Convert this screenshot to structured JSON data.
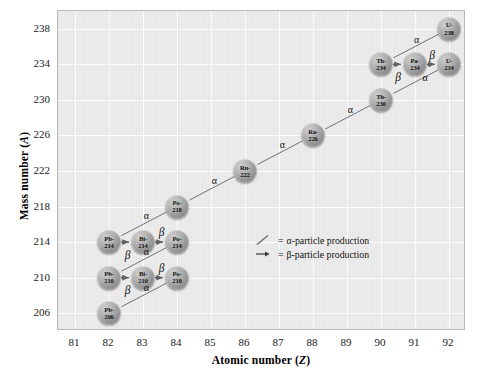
{
  "figure": {
    "x_axis": {
      "label_prefix": "Atomic number (",
      "label_var": "Z",
      "label_suffix": ")",
      "ticks": [
        81,
        82,
        83,
        84,
        85,
        86,
        87,
        88,
        89,
        90,
        91,
        92
      ],
      "min": 80.5,
      "max": 92.5
    },
    "y_axis": {
      "label_prefix": "Mass number (",
      "label_var": "A",
      "label_suffix": ")",
      "ticks": [
        238,
        234,
        230,
        226,
        222,
        218,
        214,
        210,
        206
      ],
      "min": 204,
      "max": 240
    },
    "panel_color": "#ececec",
    "grid_color": "#ffffff",
    "arrow_color": "#6a6a70",
    "bubble_color": "#9a9a9a"
  },
  "legend": {
    "items": [
      {
        "glyph": "alpha-diagonal-line",
        "equals": "=",
        "text": "α-particle production"
      },
      {
        "glyph": "beta-horizontal-arrow",
        "equals": "=",
        "text": "β-particle production"
      }
    ]
  },
  "chart_data": {
    "type": "scatter",
    "xlabel": "Atomic number (Z)",
    "ylabel": "Mass number (A)",
    "xlim": [
      80.5,
      92.5
    ],
    "ylim": [
      204,
      240
    ],
    "xticks": [
      81,
      82,
      83,
      84,
      85,
      86,
      87,
      88,
      89,
      90,
      91,
      92
    ],
    "yticks": [
      238,
      234,
      230,
      226,
      222,
      218,
      214,
      210,
      206
    ],
    "grid": true,
    "legend_position": "inside-center-right",
    "nuclides": [
      {
        "id": "U238",
        "symbol": "U-",
        "mass": "238",
        "z": 92,
        "a": 238
      },
      {
        "id": "Th234",
        "symbol": "Th-",
        "mass": "234",
        "z": 90,
        "a": 234
      },
      {
        "id": "Pa234",
        "symbol": "Pa-",
        "mass": "234",
        "z": 91,
        "a": 234
      },
      {
        "id": "U234",
        "symbol": "U-",
        "mass": "234",
        "z": 92,
        "a": 234
      },
      {
        "id": "Th230",
        "symbol": "Th-",
        "mass": "230",
        "z": 90,
        "a": 230
      },
      {
        "id": "Ra226",
        "symbol": "Ra-",
        "mass": "226",
        "z": 88,
        "a": 226
      },
      {
        "id": "Rn222",
        "symbol": "Rn-",
        "mass": "222",
        "z": 86,
        "a": 222
      },
      {
        "id": "Po218",
        "symbol": "Po-",
        "mass": "218",
        "z": 84,
        "a": 218
      },
      {
        "id": "Pb214",
        "symbol": "Pb-",
        "mass": "214",
        "z": 82,
        "a": 214
      },
      {
        "id": "Bi214",
        "symbol": "Bi-",
        "mass": "214",
        "z": 83,
        "a": 214
      },
      {
        "id": "Po214",
        "symbol": "Po-",
        "mass": "214",
        "z": 84,
        "a": 214
      },
      {
        "id": "Pb210",
        "symbol": "Pb-",
        "mass": "210",
        "z": 82,
        "a": 210
      },
      {
        "id": "Bi210",
        "symbol": "Bi-",
        "mass": "210",
        "z": 83,
        "a": 210
      },
      {
        "id": "Po210",
        "symbol": "Po-",
        "mass": "210",
        "z": 84,
        "a": 210
      },
      {
        "id": "Pb206",
        "symbol": "Pb-",
        "mass": "206",
        "z": 82,
        "a": 206
      }
    ],
    "decays": [
      {
        "from": "U238",
        "to": "Th234",
        "type": "alpha",
        "label": "α",
        "label_z": 91.05,
        "label_a": 236.9
      },
      {
        "from": "Th234",
        "to": "Pa234",
        "type": "beta",
        "label": "β",
        "label_z": 90.5,
        "label_a": 232.6
      },
      {
        "from": "Pa234",
        "to": "U234",
        "type": "beta",
        "label": "β",
        "label_z": 91.5,
        "label_a": 235.1
      },
      {
        "from": "U234",
        "to": "Th230",
        "type": "alpha",
        "label": "α",
        "label_z": 91.3,
        "label_a": 232.6
      },
      {
        "from": "Th230",
        "to": "Ra226",
        "type": "alpha",
        "label": "α",
        "label_z": 89.1,
        "label_a": 229.0
      },
      {
        "from": "Ra226",
        "to": "Rn222",
        "type": "alpha",
        "label": "α",
        "label_z": 87.1,
        "label_a": 225.0
      },
      {
        "from": "Rn222",
        "to": "Po218",
        "type": "alpha",
        "label": "α",
        "label_z": 85.1,
        "label_a": 221.0
      },
      {
        "from": "Po218",
        "to": "Pb214",
        "type": "alpha",
        "label": "α",
        "label_z": 83.1,
        "label_a": 217.0
      },
      {
        "from": "Pb214",
        "to": "Bi214",
        "type": "beta",
        "label": "β",
        "label_z": 82.55,
        "label_a": 212.6
      },
      {
        "from": "Bi214",
        "to": "Po214",
        "type": "beta",
        "label": "β",
        "label_z": 83.55,
        "label_a": 215.1
      },
      {
        "from": "Po214",
        "to": "Pb210",
        "type": "alpha",
        "label": "α",
        "label_z": 83.1,
        "label_a": 213.0
      },
      {
        "from": "Pb210",
        "to": "Bi210",
        "type": "beta",
        "label": "β",
        "label_z": 82.55,
        "label_a": 208.6
      },
      {
        "from": "Bi210",
        "to": "Po210",
        "type": "beta",
        "label": "β",
        "label_z": 83.55,
        "label_a": 211.1
      },
      {
        "from": "Po210",
        "to": "Pb206",
        "type": "alpha",
        "label": "α",
        "label_z": 83.1,
        "label_a": 209.0
      }
    ]
  }
}
